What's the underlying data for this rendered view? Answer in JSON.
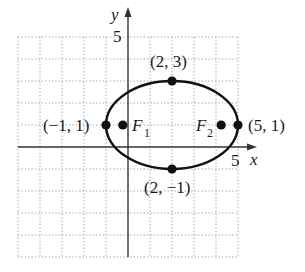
{
  "diagram": {
    "type": "ellipse-graph",
    "axes": {
      "x_label": "x",
      "y_label": "y",
      "x_tick_label": "5",
      "y_tick_label": "5",
      "x_range": [
        -5,
        5
      ],
      "y_range": [
        -5,
        5
      ],
      "grid": "dotted, unit spacing"
    },
    "ellipse": {
      "center": [
        2,
        1
      ],
      "semi_major": 3,
      "semi_minor": 2,
      "orientation": "horizontal"
    },
    "points": [
      {
        "label": "(2, 3)",
        "x": 2,
        "y": 3,
        "role": "vertex-top"
      },
      {
        "label": "(2, −1)",
        "x": 2,
        "y": -1,
        "role": "vertex-bottom"
      },
      {
        "label": "(−1, 1)",
        "x": -1,
        "y": 1,
        "role": "vertex-left"
      },
      {
        "label": "(5, 1)",
        "x": 5,
        "y": 1,
        "role": "vertex-right"
      }
    ],
    "foci": [
      {
        "label": "F",
        "subscript": "1",
        "x": -0.236,
        "y": 1
      },
      {
        "label": "F",
        "subscript": "2",
        "x": 4.236,
        "y": 1
      }
    ],
    "colors": {
      "curve": "#111111",
      "grid": "#9a9a9a",
      "axes": "#333333"
    }
  }
}
